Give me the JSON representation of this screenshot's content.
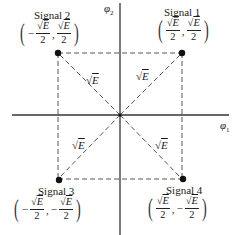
{
  "diagram": {
    "type": "signal-space constellation",
    "axes": {
      "horizontal_label": "φ",
      "horizontal_subscript": "1",
      "vertical_label": "φ",
      "vertical_subscript": "2"
    },
    "edge_label": {
      "radical": "√",
      "symbol": "E"
    },
    "signals": [
      {
        "id": 1,
        "name": "Signal 1",
        "x_sign": "",
        "y_sign": "",
        "numerator": "E",
        "denominator": "2"
      },
      {
        "id": 2,
        "name": "Signal 2",
        "x_sign": "−",
        "y_sign": "",
        "numerator": "E",
        "denominator": "2"
      },
      {
        "id": 3,
        "name": "Signal 3",
        "x_sign": "−",
        "y_sign": "−",
        "numerator": "E",
        "denominator": "2"
      },
      {
        "id": 4,
        "name": "Signal 4",
        "x_sign": "",
        "y_sign": "−",
        "numerator": "E",
        "denominator": "2"
      }
    ],
    "punctuation": {
      "open": "(",
      "close": ")",
      "comma": ","
    },
    "colors": {
      "ink": "#1a1a1a",
      "dashes": "#555555",
      "axis": "#333333"
    }
  }
}
